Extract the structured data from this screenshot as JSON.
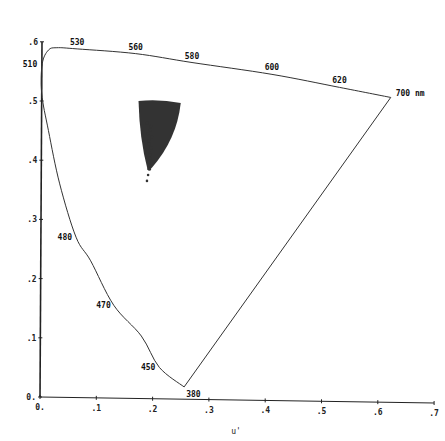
{
  "chart_data": {
    "type": "scatter",
    "title": "",
    "xlabel": "u'",
    "ylabel": "",
    "xlim": [
      0,
      0.7
    ],
    "ylim": [
      0,
      0.6
    ],
    "grid": false,
    "x_ticks": [
      "0.",
      ".1",
      ".2",
      ".3",
      ".4",
      ".5",
      ".6",
      ".7"
    ],
    "y_ticks": [
      "0.",
      ".1",
      ".2",
      ".3",
      ".4",
      ".5",
      ".6"
    ],
    "spectral_locus": {
      "name": "Spectrum locus (CIE 1976 u'v')",
      "points": [
        {
          "u": 0.256,
          "v": 0.017,
          "nm": "380"
        },
        {
          "u": 0.212,
          "v": 0.05,
          "nm": "450"
        },
        {
          "u": 0.18,
          "v": 0.103,
          "nm": ""
        },
        {
          "u": 0.131,
          "v": 0.155,
          "nm": "470"
        },
        {
          "u": 0.09,
          "v": 0.23,
          "nm": ""
        },
        {
          "u": 0.064,
          "v": 0.27,
          "nm": "480"
        },
        {
          "u": 0.035,
          "v": 0.36,
          "nm": ""
        },
        {
          "u": 0.015,
          "v": 0.45,
          "nm": ""
        },
        {
          "u": 0.003,
          "v": 0.513,
          "nm": ""
        },
        {
          "u": 0.004,
          "v": 0.563,
          "nm": "510"
        },
        {
          "u": 0.015,
          "v": 0.586,
          "nm": ""
        },
        {
          "u": 0.03,
          "v": 0.59,
          "nm": ""
        },
        {
          "u": 0.066,
          "v": 0.588,
          "nm": "530"
        },
        {
          "u": 0.17,
          "v": 0.58,
          "nm": "560"
        },
        {
          "u": 0.27,
          "v": 0.565,
          "nm": "580"
        },
        {
          "u": 0.412,
          "v": 0.545,
          "nm": "600"
        },
        {
          "u": 0.532,
          "v": 0.523,
          "nm": "620"
        },
        {
          "u": 0.623,
          "v": 0.506,
          "nm": "700 nm"
        }
      ],
      "purple_line": [
        {
          "u": 0.623,
          "v": 0.506
        },
        {
          "u": 0.256,
          "v": 0.017
        }
      ]
    },
    "wavelength_labels": [
      "380",
      "450",
      "470",
      "480",
      "510",
      "530",
      "560",
      "580",
      "600",
      "620",
      "700 nm"
    ],
    "data_cluster": {
      "name": "dense point cloud",
      "shape": "wedge/triangle, wide at top narrowing downward",
      "top_edge": {
        "u_min": 0.175,
        "u_max": 0.25,
        "v": 0.5
      },
      "apex": {
        "u": 0.193,
        "v": 0.37
      },
      "trailing_points": [
        {
          "u": 0.193,
          "v": 0.385
        },
        {
          "u": 0.192,
          "v": 0.375
        },
        {
          "u": 0.19,
          "v": 0.365
        }
      ],
      "color": "#333333"
    },
    "colors": {
      "axes": "#222222",
      "locus": "#333333",
      "cluster": "#2a2a2a"
    }
  }
}
